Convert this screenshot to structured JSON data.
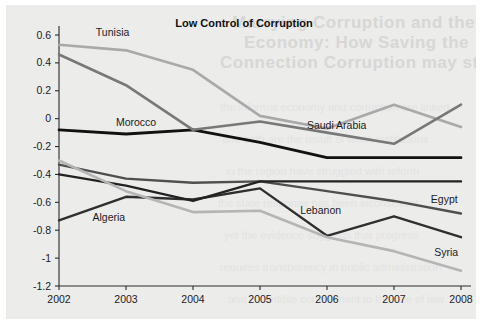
{
  "page": {
    "background_color": "#ececeb",
    "showthrough_lines": [
      "Marrying Corruption and the Informal",
      "Economy: How Saving the",
      "Connection Corruption may stop the Informal"
    ],
    "showthrough_faint_lines": [
      "the informal economy and corruption are linked",
      "and both are the result of weak institutions",
      "in the region have struggled with reform",
      "the state response has been inconsistent",
      "yet the evidence suggests that progress",
      "requires transparency in public administration",
      "and a credible commitment to the rule of law"
    ]
  },
  "chart_data": {
    "type": "line",
    "title": "Low Control of Corruption",
    "xlabel": "",
    "ylabel": "",
    "x": [
      2002,
      2003,
      2004,
      2005,
      2006,
      2007,
      2008
    ],
    "categories": [
      "2002",
      "2003",
      "2004",
      "2005",
      "2006",
      "2007",
      "2008"
    ],
    "xlim": [
      2002,
      2008
    ],
    "ylim": [
      -1.2,
      0.6
    ],
    "ytick_labels": [
      "0.6",
      "0.4",
      "0.2",
      "0",
      "-0.2",
      "-0.4",
      "-0.6",
      "-0.8",
      "-1",
      "-1.2"
    ],
    "ytick_values": [
      0.6,
      0.4,
      0.2,
      0,
      -0.2,
      -0.4,
      -0.6,
      -0.8,
      -1.0,
      -1.2
    ],
    "grid": false,
    "legend_position": "inline-labels",
    "series": [
      {
        "name": "Tunisia",
        "color": "#a9a9a9",
        "width": 2.6,
        "values": [
          0.53,
          0.49,
          0.35,
          0.02,
          -0.07,
          0.1,
          -0.06
        ],
        "label_x": 2002.55,
        "label_y": 0.59
      },
      {
        "name": "Morocco",
        "color": "#111111",
        "width": 2.8,
        "values": [
          -0.08,
          -0.11,
          -0.08,
          -0.17,
          -0.28,
          -0.28,
          -0.28
        ],
        "label_x": 2002.85,
        "label_y": -0.055
      },
      {
        "name": "Saudi Arabia",
        "color": "#787878",
        "width": 2.6,
        "values": [
          0.46,
          0.24,
          -0.08,
          -0.02,
          -0.1,
          -0.18,
          0.1
        ],
        "label_x": 2005.7,
        "label_y": -0.075
      },
      {
        "name": "Egypt",
        "color": "#4f4f4f",
        "width": 2.4,
        "values": [
          -0.33,
          -0.43,
          -0.46,
          -0.45,
          -0.52,
          -0.59,
          -0.68
        ],
        "label_x": 2007.55,
        "label_y": -0.605
      },
      {
        "name": "Algeria",
        "color": "#2f2f2f",
        "width": 2.4,
        "values": [
          -0.73,
          -0.56,
          -0.58,
          -0.5,
          -0.84,
          -0.7,
          -0.85
        ],
        "label_x": 2002.5,
        "label_y": -0.735
      },
      {
        "name": "Lebanon",
        "color": "#222222",
        "width": 2.4,
        "values": [
          -0.4,
          -0.48,
          -0.59,
          -0.45,
          -0.45,
          -0.45,
          -0.45
        ],
        "label_x": 2005.6,
        "label_y": -0.685
      },
      {
        "name": "Syria",
        "color": "#b5b5b5",
        "width": 2.6,
        "values": [
          -0.3,
          -0.52,
          -0.67,
          -0.66,
          -0.85,
          -0.95,
          -1.09
        ],
        "label_x": 2007.6,
        "label_y": -0.985
      }
    ]
  }
}
